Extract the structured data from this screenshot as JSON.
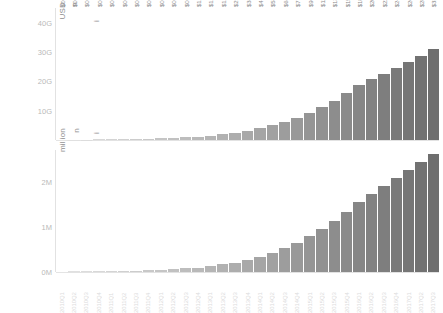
{
  "axis_titles": {
    "top_unit": "USD",
    "top_fragment_1": "n",
    "top_fragment_2": "i",
    "bottom_unit": "million",
    "bottom_fragment_1": "n",
    "bottom_fragment_2": "i"
  },
  "chart_data": [
    {
      "type": "bar",
      "id": "revenue-panel",
      "title": "",
      "xlabel": "",
      "ylabel": "USD",
      "ylim": [
        0,
        45
      ],
      "yticks": [
        10,
        20,
        30,
        40
      ],
      "ytick_labels": [
        "10G",
        "20G",
        "30G",
        "40G"
      ],
      "grid": false,
      "legend": "none",
      "categories": [
        "2010Q1",
        "2010Q2",
        "2010Q3",
        "2010Q4",
        "2011Q1",
        "2011Q2",
        "2011Q3",
        "2011Q4",
        "2012Q1",
        "2012Q2",
        "2012Q3",
        "2012Q4",
        "2013Q1",
        "2013Q2",
        "2013Q3",
        "2013Q4",
        "2014Q1",
        "2014Q2",
        "2014Q3",
        "2014Q4",
        "2015Q1",
        "2015Q2",
        "2015Q3",
        "2015Q4",
        "2016Q1",
        "2016Q2",
        "2016Q3",
        "2016Q4",
        "2017Q1",
        "2017Q2",
        "2017Q3"
      ],
      "values": [
        0.1,
        0.13,
        0.17,
        0.2,
        0.25,
        0.3,
        0.37,
        0.46,
        0.57,
        0.71,
        0.91,
        1.18,
        1.53,
        1.98,
        2.54,
        3.24,
        4.03,
        5.04,
        6.21,
        7.62,
        9.26,
        11.17,
        13.4,
        15.99,
        18.73,
        20.69,
        22.66,
        24.65,
        26.61,
        28.75,
        31.2
      ],
      "data_labels": [
        "$0.10B",
        "$0.13B",
        "$0.17B",
        "$0.20B",
        "$0.25B",
        "$0.30B",
        "$0.37B",
        "$0.46B",
        "$0.57B",
        "$0.71B",
        "$0.91B",
        "$1.18B",
        "$1.53B",
        "$1.98B",
        "$2.54B",
        "$3.24B",
        "$4.03B",
        "$5.04B",
        "$6.21B",
        "$7.62B",
        "$9.26B",
        "$11.17B",
        "$13.40B",
        "$15.99B",
        "$18.73B",
        "$20.69B",
        "$22.66B",
        "$24.65B",
        "$26.61B",
        "$28.75B",
        "$31.20B"
      ]
    },
    {
      "type": "bar",
      "id": "volume-panel",
      "title": "",
      "xlabel": "",
      "ylabel": "million",
      "ylim": [
        0,
        2.7
      ],
      "yticks": [
        0,
        1,
        2
      ],
      "ytick_labels": [
        "0M",
        "1M",
        "2M"
      ],
      "grid": false,
      "legend": "none",
      "categories": [
        "2010Q1",
        "2010Q2",
        "2010Q3",
        "2010Q4",
        "2011Q1",
        "2011Q2",
        "2011Q3",
        "2011Q4",
        "2012Q1",
        "2012Q2",
        "2012Q3",
        "2012Q4",
        "2013Q1",
        "2013Q2",
        "2013Q3",
        "2013Q4",
        "2014Q1",
        "2014Q2",
        "2014Q3",
        "2014Q4",
        "2015Q1",
        "2015Q2",
        "2015Q3",
        "2015Q4",
        "2016Q1",
        "2016Q2",
        "2016Q3",
        "2016Q4",
        "2017Q1",
        "2017Q2",
        "2017Q3"
      ],
      "values": [
        0.01,
        0.012,
        0.015,
        0.018,
        0.022,
        0.027,
        0.033,
        0.04,
        0.05,
        0.062,
        0.078,
        0.1,
        0.13,
        0.17,
        0.21,
        0.27,
        0.34,
        0.43,
        0.53,
        0.65,
        0.79,
        0.95,
        1.13,
        1.33,
        1.54,
        1.73,
        1.91,
        2.08,
        2.26,
        2.44,
        2.62
      ]
    }
  ],
  "bar_colors": {
    "light": "#e4e4e4",
    "dark": "#6e6e6e"
  }
}
